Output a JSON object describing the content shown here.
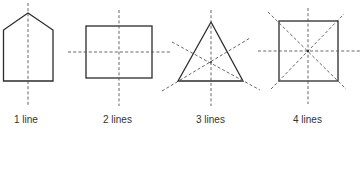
{
  "colors": {
    "shape_stroke": "#2b2b2b",
    "axis_stroke": "#555555",
    "text": "#333333",
    "background": "#ffffff"
  },
  "figures": [
    {
      "shape": "pentagon (house)",
      "lines_of_symmetry": 1,
      "label": "1 line"
    },
    {
      "shape": "rectangle",
      "lines_of_symmetry": 2,
      "label": "2 lines"
    },
    {
      "shape": "equilateral triangle",
      "lines_of_symmetry": 3,
      "label": "3 lines"
    },
    {
      "shape": "square",
      "lines_of_symmetry": 4,
      "label": "4 lines"
    }
  ]
}
